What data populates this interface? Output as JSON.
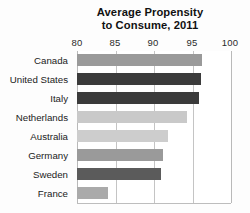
{
  "chart_data": {
    "type": "bar",
    "orientation": "horizontal",
    "title": "Average Propensity to Consume, 2011",
    "title_lines": [
      "Average Propensity",
      "to Consume, 2011"
    ],
    "xlabel": "",
    "ylabel": "",
    "xlim": [
      80,
      100
    ],
    "xticks": [
      80,
      85,
      90,
      95,
      100
    ],
    "xtick_labels": [
      "80",
      "85",
      "90",
      "95",
      "100"
    ],
    "grid": true,
    "legend": false,
    "categories": [
      "Canada",
      "United States",
      "Italy",
      "Netherlands",
      "Australia",
      "Germany",
      "Sweden",
      "France"
    ],
    "values": [
      96.3,
      96.2,
      96.0,
      94.4,
      91.9,
      91.2,
      91.0,
      84.0
    ],
    "bar_colors": [
      "#9a9a9a",
      "#3b3b3b",
      "#3b3b3b",
      "#c9c9c9",
      "#cdcdcd",
      "#9a9a9a",
      "#5b5b5b",
      "#aaaaaa"
    ],
    "bars": [
      {
        "label": "Canada",
        "value": 96.3,
        "color": "#9a9a9a"
      },
      {
        "label": "United States",
        "value": 96.2,
        "color": "#3b3b3b"
      },
      {
        "label": "Italy",
        "value": 96.0,
        "color": "#3b3b3b"
      },
      {
        "label": "Netherlands",
        "value": 94.4,
        "color": "#c9c9c9"
      },
      {
        "label": "Australia",
        "value": 91.9,
        "color": "#cdcdcd"
      },
      {
        "label": "Germany",
        "value": 91.2,
        "color": "#9a9a9a"
      },
      {
        "label": "Sweden",
        "value": 91.0,
        "color": "#5b5b5b"
      },
      {
        "label": "France",
        "value": 84.0,
        "color": "#aaaaaa"
      }
    ],
    "colors": {
      "plot_background": "#ffffff",
      "figure_background": "#fdfdfd",
      "gridline": "#c4c4c4",
      "text": "#222222"
    }
  }
}
